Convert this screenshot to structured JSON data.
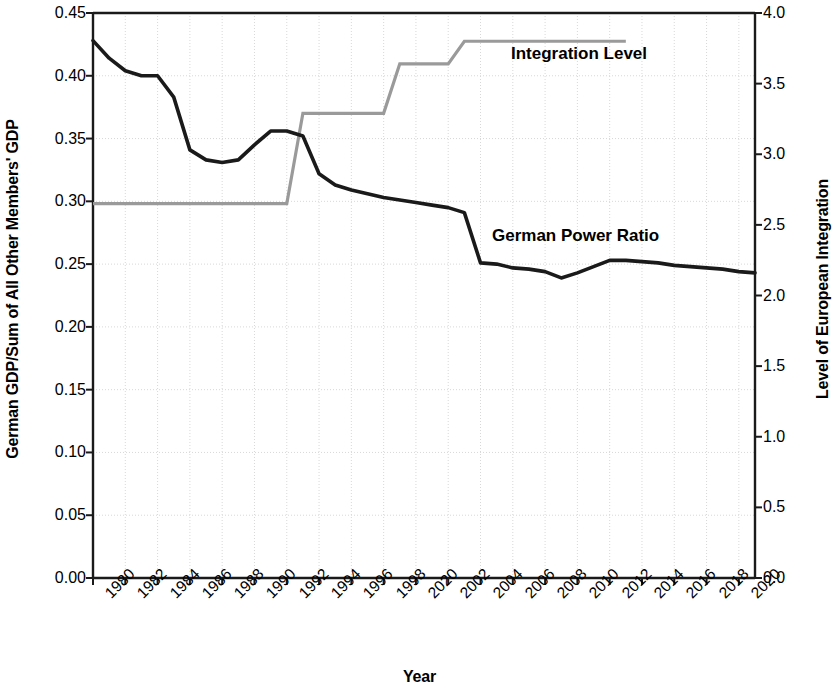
{
  "chart_data": {
    "type": "line",
    "title": "",
    "xlabel": "Year",
    "ylabel": "German GDP/Sum of All Other Members' GDP",
    "ylabel_right": "Level of European Integration",
    "xlim": [
      1980,
      2021
    ],
    "ylim": [
      0.0,
      0.45
    ],
    "ylim_right": [
      0.0,
      4.0
    ],
    "grid": true,
    "legend_position": "inline-annotations",
    "x_tick_labels": [
      "1980",
      "1982",
      "1984",
      "1986",
      "1988",
      "1990",
      "1992",
      "1994",
      "1996",
      "1998",
      "2020",
      "2002",
      "2004",
      "2006",
      "2008",
      "2010",
      "2012",
      "2014",
      "2016",
      "2018",
      "2020"
    ],
    "x_tick_values": [
      1980,
      1982,
      1984,
      1986,
      1988,
      1990,
      1992,
      1994,
      1996,
      1998,
      2000,
      2002,
      2004,
      2006,
      2008,
      2010,
      2012,
      2014,
      2016,
      2018,
      2020
    ],
    "y_tick_labels_left": [
      "0.45",
      "0.40",
      "0.35",
      "0.30",
      "0.25",
      "0.20",
      "0.15",
      "0.10",
      "0.05",
      "0.00"
    ],
    "y_tick_values_left": [
      0.45,
      0.4,
      0.35,
      0.3,
      0.25,
      0.2,
      0.15,
      0.1,
      0.05,
      0.0
    ],
    "y_tick_labels_right": [
      "4.0",
      "3.5",
      "3.0",
      "2.5",
      "2.0",
      "1.5",
      "1.0",
      "0.5",
      "0.0"
    ],
    "y_tick_values_right": [
      4.0,
      3.5,
      3.0,
      2.5,
      2.0,
      1.5,
      1.0,
      0.5,
      0.0
    ],
    "series": [
      {
        "name": "German Power Ratio",
        "axis": "left",
        "color": "#1a1a1a",
        "x": [
          1980,
          1981,
          1982,
          1983,
          1984,
          1985,
          1986,
          1987,
          1988,
          1989,
          1990,
          1991,
          1992,
          1993,
          1994,
          1995,
          1996,
          1997,
          1998,
          1999,
          2000,
          2001,
          2002,
          2003,
          2004,
          2005,
          2006,
          2007,
          2008,
          2009,
          2010,
          2011,
          2012,
          2013,
          2014,
          2015,
          2016,
          2017,
          2018,
          2019,
          2020,
          2021
        ],
        "values": [
          0.428,
          0.414,
          0.404,
          0.4,
          0.4,
          0.383,
          0.341,
          0.333,
          0.331,
          0.333,
          0.345,
          0.356,
          0.356,
          0.352,
          0.322,
          0.313,
          0.309,
          0.306,
          0.303,
          0.301,
          0.299,
          0.297,
          0.295,
          0.291,
          0.251,
          0.25,
          0.247,
          0.246,
          0.244,
          0.239,
          0.243,
          0.248,
          0.253,
          0.253,
          0.252,
          0.251,
          0.249,
          0.248,
          0.247,
          0.246,
          0.244,
          0.243
        ]
      },
      {
        "name": "Integration Level",
        "axis": "right",
        "color": "#9a9a9a",
        "step": true,
        "x": [
          1980,
          1981,
          1982,
          1983,
          1984,
          1985,
          1986,
          1987,
          1988,
          1989,
          1990,
          1991,
          1992,
          1993,
          1994,
          1995,
          1996,
          1997,
          1998,
          1999,
          2000,
          2001,
          2002,
          2003,
          2004,
          2005,
          2006,
          2007,
          2008,
          2009,
          2010,
          2011,
          2012,
          2013
        ],
        "values": [
          2.65,
          2.65,
          2.65,
          2.65,
          2.65,
          2.65,
          2.65,
          2.65,
          2.65,
          2.65,
          2.65,
          2.65,
          2.65,
          3.29,
          3.29,
          3.29,
          3.29,
          3.29,
          3.29,
          3.64,
          3.64,
          3.64,
          3.64,
          3.8,
          3.8,
          3.8,
          3.8,
          3.8,
          3.8,
          3.8,
          3.8,
          3.8,
          3.8,
          3.8
        ]
      }
    ],
    "annotations": [
      {
        "text": "Integration Level",
        "x": 2004,
        "y_right": 3.55
      },
      {
        "text": "German Power Ratio",
        "x": 2003,
        "y_left": 0.272
      }
    ]
  },
  "axes": {
    "left_title": "German GDP/Sum of All Other Members' GDP",
    "right_title": "Level of European Integration",
    "bottom_title": "Year"
  },
  "labels": {
    "integration": "Integration Level",
    "power_ratio": "German Power Ratio"
  },
  "colors": {
    "power_line": "#1a1a1a",
    "integration_line": "#9a9a9a",
    "grid": "#d8d8d8",
    "axis": "#1a1a1a"
  }
}
